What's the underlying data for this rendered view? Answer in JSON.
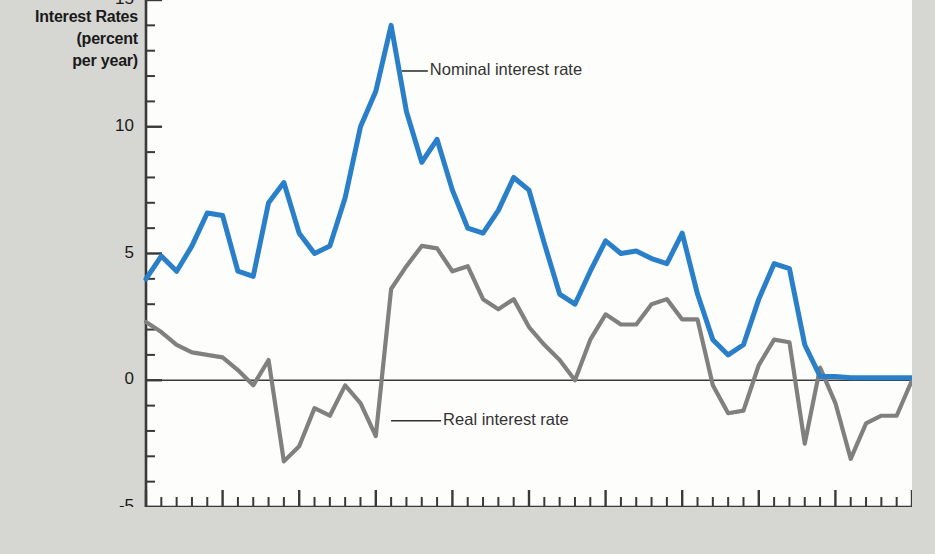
{
  "figure": {
    "y_axis_title_lines": [
      "Interest Rates",
      "(percent",
      "per year)"
    ],
    "background_color": "#d6d6d2",
    "panel_color": "#fdfdfb"
  },
  "annotations": {
    "nominal": {
      "label": "Nominal interest rate",
      "x": 1981.7,
      "y": 12.2
    },
    "real": {
      "label": "Real interest rate",
      "x": 1981.0,
      "y": -1.6
    }
  },
  "chart_data": {
    "type": "line",
    "title": "",
    "subtitle": "",
    "xlabel": "",
    "ylabel": "Interest Rates (percent per year)",
    "xlim": [
      1965,
      2015
    ],
    "ylim": [
      -5,
      15
    ],
    "xticks": [
      1965,
      1970,
      1975,
      1980,
      1985,
      1990,
      1995,
      2000,
      2005,
      2010,
      2015
    ],
    "xtick_labels": [
      "1965",
      "1970",
      "1975",
      "1980",
      "1985",
      "1990",
      "1995",
      "2000",
      "2005",
      "2010",
      "2015"
    ],
    "yticks": [
      -5,
      0,
      5,
      10,
      15
    ],
    "ytick_labels": [
      "-5",
      "0",
      "5",
      "10",
      "15"
    ],
    "minor_xtick_interval": 1,
    "minor_ytick_interval": 1,
    "grid": false,
    "legend": "inline-annotations",
    "zero_line": true,
    "colors": {
      "nominal": "#2a7fc9",
      "real": "#808080",
      "axis": "#3a3a3a",
      "zero_line": "#3a3a3a"
    },
    "x": [
      1965,
      1966,
      1967,
      1968,
      1969,
      1970,
      1971,
      1972,
      1973,
      1974,
      1975,
      1976,
      1977,
      1978,
      1979,
      1980,
      1981,
      1982,
      1983,
      1984,
      1985,
      1986,
      1987,
      1988,
      1989,
      1990,
      1991,
      1992,
      1993,
      1994,
      1995,
      1996,
      1997,
      1998,
      1999,
      2000,
      2001,
      2002,
      2003,
      2004,
      2005,
      2006,
      2007,
      2008,
      2009,
      2010,
      2011,
      2012,
      2013,
      2014,
      2015
    ],
    "series": [
      {
        "name": "Nominal interest rate",
        "color": "#2a7fc9",
        "values": [
          4.0,
          4.9,
          4.3,
          5.3,
          6.6,
          6.5,
          4.3,
          4.1,
          7.0,
          7.8,
          5.8,
          5.0,
          5.3,
          7.2,
          10.0,
          11.4,
          14.0,
          10.6,
          8.6,
          9.5,
          7.5,
          6.0,
          5.8,
          6.7,
          8.0,
          7.5,
          5.4,
          3.4,
          3.0,
          4.3,
          5.5,
          5.0,
          5.1,
          4.8,
          4.6,
          5.8,
          3.4,
          1.6,
          1.0,
          1.4,
          3.2,
          4.6,
          4.4,
          1.4,
          0.15,
          0.15,
          0.1,
          0.1,
          0.1,
          0.1,
          0.1
        ]
      },
      {
        "name": "Real interest rate",
        "color": "#808080",
        "values": [
          2.3,
          1.9,
          1.4,
          1.1,
          1.0,
          0.9,
          0.4,
          -0.2,
          0.8,
          -3.2,
          -2.6,
          -1.1,
          -1.4,
          -0.2,
          -0.9,
          -2.2,
          3.6,
          4.5,
          5.3,
          5.2,
          4.3,
          4.5,
          3.2,
          2.8,
          3.2,
          2.1,
          1.4,
          0.8,
          0.0,
          1.6,
          2.6,
          2.2,
          2.2,
          3.0,
          3.2,
          2.4,
          2.4,
          -0.2,
          -1.3,
          -1.2,
          0.6,
          1.6,
          1.5,
          -2.5,
          0.5,
          -0.9,
          -3.1,
          -1.7,
          -1.4,
          -1.4,
          0.0
        ]
      }
    ]
  }
}
